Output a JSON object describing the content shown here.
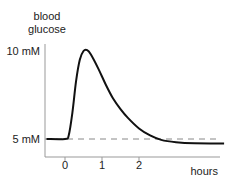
{
  "chart_data": {
    "type": "line",
    "title": "",
    "ylabel_lines": [
      "blood",
      "glucose"
    ],
    "xlabel": "hours",
    "y_ticks": [
      {
        "value": 10,
        "label": "10 mM"
      },
      {
        "value": 5,
        "label": "5 mM"
      }
    ],
    "x_ticks": [
      {
        "value": 0,
        "label": "0"
      },
      {
        "value": 1,
        "label": "1"
      },
      {
        "value": 2,
        "label": "2"
      }
    ],
    "xlim": [
      -0.5,
      4.3
    ],
    "ylim": [
      4,
      10.5
    ],
    "baseline": {
      "value": 5,
      "style": "dashed"
    },
    "series": [
      {
        "name": "blood glucose",
        "points": [
          [
            -0.5,
            5.0
          ],
          [
            0.0,
            5.0
          ],
          [
            0.1,
            5.2
          ],
          [
            0.2,
            6.5
          ],
          [
            0.3,
            8.3
          ],
          [
            0.4,
            9.5
          ],
          [
            0.5,
            10.0
          ],
          [
            0.6,
            10.05
          ],
          [
            0.7,
            9.8
          ],
          [
            0.9,
            9.0
          ],
          [
            1.1,
            8.1
          ],
          [
            1.3,
            7.3
          ],
          [
            1.5,
            6.7
          ],
          [
            1.7,
            6.2
          ],
          [
            2.0,
            5.6
          ],
          [
            2.3,
            5.2
          ],
          [
            2.6,
            4.95
          ],
          [
            3.0,
            4.82
          ],
          [
            3.5,
            4.76
          ],
          [
            4.3,
            4.75
          ]
        ]
      }
    ]
  }
}
